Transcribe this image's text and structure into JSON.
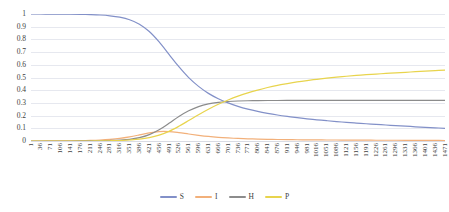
{
  "chart_data": {
    "type": "line",
    "title": "",
    "xlabel": "",
    "ylabel": "",
    "ylim": [
      0,
      1
    ],
    "xlim": [
      1,
      1471
    ],
    "grid": true,
    "legend_position": "bottom",
    "y_ticks": [
      "0",
      "0.1",
      "0.2",
      "0.3",
      "0.4",
      "0.5",
      "0.6",
      "0.7",
      "0.8",
      "0.9",
      "1"
    ],
    "x_ticks": [
      "1",
      "36",
      "71",
      "106",
      "141",
      "176",
      "211",
      "246",
      "281",
      "316",
      "351",
      "386",
      "421",
      "456",
      "491",
      "526",
      "561",
      "596",
      "631",
      "666",
      "701",
      "736",
      "771",
      "806",
      "841",
      "876",
      "911",
      "946",
      "981",
      "1016",
      "1051",
      "1086",
      "1121",
      "1156",
      "1191",
      "1226",
      "1261",
      "1296",
      "1331",
      "1366",
      "1401",
      "1436",
      "1471"
    ],
    "x": [
      1,
      36,
      71,
      106,
      141,
      176,
      211,
      246,
      281,
      316,
      351,
      386,
      421,
      456,
      491,
      526,
      561,
      596,
      631,
      666,
      701,
      736,
      771,
      806,
      841,
      876,
      911,
      946,
      981,
      1016,
      1051,
      1086,
      1121,
      1156,
      1191,
      1226,
      1261,
      1296,
      1331,
      1366,
      1401,
      1436,
      1471
    ],
    "series": [
      {
        "name": "S",
        "color": "#8290c8",
        "values": [
          1.0,
          1.0,
          0.999,
          0.999,
          0.998,
          0.997,
          0.995,
          0.992,
          0.986,
          0.975,
          0.955,
          0.92,
          0.862,
          0.78,
          0.682,
          0.585,
          0.499,
          0.43,
          0.375,
          0.333,
          0.3,
          0.273,
          0.251,
          0.233,
          0.218,
          0.205,
          0.194,
          0.184,
          0.175,
          0.167,
          0.16,
          0.153,
          0.147,
          0.141,
          0.136,
          0.131,
          0.126,
          0.121,
          0.117,
          0.112,
          0.108,
          0.104,
          0.1
        ]
      },
      {
        "name": "I",
        "color": "#f2b07a",
        "values": [
          0.0,
          0.0,
          0.001,
          0.001,
          0.002,
          0.003,
          0.005,
          0.008,
          0.013,
          0.021,
          0.033,
          0.048,
          0.064,
          0.074,
          0.074,
          0.066,
          0.055,
          0.045,
          0.036,
          0.029,
          0.024,
          0.02,
          0.017,
          0.015,
          0.013,
          0.012,
          0.011,
          0.01,
          0.009,
          0.009,
          0.008,
          0.008,
          0.007,
          0.007,
          0.007,
          0.006,
          0.006,
          0.006,
          0.005,
          0.005,
          0.005,
          0.005,
          0.004
        ]
      },
      {
        "name": "H",
        "color": "#8c8c8c",
        "values": [
          0.0,
          0.0,
          0.0,
          0.0,
          0.0,
          0.001,
          0.001,
          0.002,
          0.004,
          0.007,
          0.013,
          0.026,
          0.05,
          0.088,
          0.139,
          0.193,
          0.238,
          0.271,
          0.292,
          0.304,
          0.311,
          0.315,
          0.317,
          0.318,
          0.319,
          0.319,
          0.32,
          0.32,
          0.32,
          0.32,
          0.32,
          0.32,
          0.32,
          0.32,
          0.32,
          0.32,
          0.32,
          0.32,
          0.32,
          0.32,
          0.32,
          0.32,
          0.32
        ]
      },
      {
        "name": "P",
        "color": "#e8d44d",
        "values": [
          0.0,
          0.0,
          0.0,
          0.0,
          0.0,
          0.0,
          0.0,
          0.001,
          0.002,
          0.004,
          0.008,
          0.014,
          0.026,
          0.046,
          0.076,
          0.116,
          0.161,
          0.207,
          0.25,
          0.289,
          0.323,
          0.353,
          0.379,
          0.401,
          0.421,
          0.438,
          0.452,
          0.465,
          0.476,
          0.486,
          0.495,
          0.503,
          0.51,
          0.516,
          0.522,
          0.527,
          0.532,
          0.537,
          0.541,
          0.546,
          0.55,
          0.554,
          0.558
        ]
      }
    ],
    "legend": [
      {
        "label": "S",
        "color": "#8290c8"
      },
      {
        "label": "I",
        "color": "#f2b07a"
      },
      {
        "label": "H",
        "color": "#8c8c8c"
      },
      {
        "label": "P",
        "color": "#e8d44d"
      }
    ]
  }
}
